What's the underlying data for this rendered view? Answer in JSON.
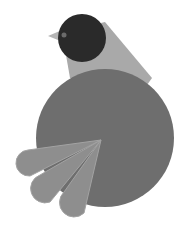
{
  "image": {
    "description": "Stylized geometric bird illustration",
    "alt": "Bird illustration"
  },
  "colors": {
    "background": "#ffffff",
    "head": "#2a2a2a",
    "eye": "#6b6b6b",
    "neck": "#a9a9a9",
    "beak": "#b5b5b5",
    "body": "#6e6e6e",
    "tail": "#8e8e8e",
    "tail_lines": "#a3a3a3"
  }
}
